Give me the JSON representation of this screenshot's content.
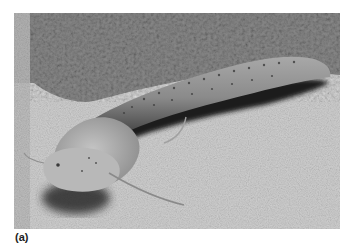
{
  "figure": {
    "label": "(a)",
    "photo": {
      "subject": "spotted elongated fish (lungfish) resting on sandy substrate",
      "tone": "grayscale",
      "colors": {
        "sand_light": "#d6d6d6",
        "sand_mid": "#b8b8b8",
        "rock_dark": "#6e6e6e",
        "body": "#9a9a9a",
        "body_shadow": "#1e1e1e",
        "head": "#b5b5b5"
      }
    }
  }
}
